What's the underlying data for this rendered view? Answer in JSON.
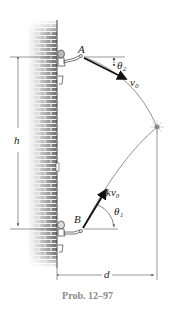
{
  "figure": {
    "labels": {
      "point_a": "A",
      "point_b": "B",
      "theta_2": "θ₂",
      "theta_1": "θ₁",
      "v0": "v₀",
      "kv0": "kv₀",
      "height": "h",
      "distance": "d"
    },
    "caption": "Prob. 12–97",
    "colors": {
      "line": "#555555",
      "arrow": "#111111",
      "wall_mortar": "#f2f2f2",
      "wall_brick": "#7a7a7a",
      "caption": "#8a8a8a"
    }
  }
}
